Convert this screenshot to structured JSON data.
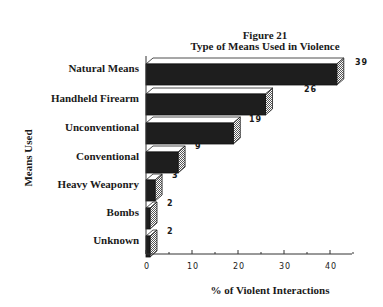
{
  "chart_data": {
    "type": "bar",
    "orientation": "horizontal",
    "style": "3d",
    "title": "Figure 21",
    "subtitle": "Type of Means Used in Violence",
    "xlabel": "% of Violent Interactions",
    "ylabel": "Means Used",
    "categories": [
      "Natural Means",
      "Handheld Firearm",
      "Unconventional",
      "Conventional",
      "Heavy Weaponry",
      "Bombs",
      "Unknown"
    ],
    "values": [
      39,
      26,
      19,
      9,
      3,
      2,
      2
    ],
    "xlim": [
      0,
      45
    ],
    "xticks": [
      0,
      10,
      20,
      30,
      40
    ],
    "grid": false,
    "legend": null
  },
  "colors": {
    "bar_front": "#1e1e1e",
    "bar_top": "#ffffff",
    "bar_side": "#9a9a9a",
    "axis": "#333333"
  },
  "labels": {
    "title": "Figure 21",
    "subtitle": "Type of Means Used in Violence",
    "xlabel": "% of Violent Interactions",
    "ylabel": "Means Used",
    "ticks": [
      "0",
      "10",
      "20",
      "30",
      "40"
    ],
    "categories": [
      "Natural Means",
      "Handheld Firearm",
      "Unconventional",
      "Conventional",
      "Heavy Weaponry",
      "Bombs",
      "Unknown"
    ],
    "values": [
      "39",
      "26",
      "19",
      "9",
      "3",
      "2",
      "2"
    ]
  }
}
